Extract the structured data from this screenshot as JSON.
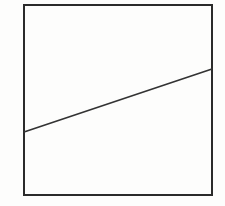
{
  "figure": {
    "background_color": "#fdfdfc",
    "square": {
      "x": 24,
      "y": 5,
      "width": 188,
      "height": 190,
      "stroke_color": "#2b2b2b",
      "stroke_width": 2,
      "fill": "none"
    },
    "diagonal_line": {
      "x1": 24,
      "y1": 132,
      "x2": 212,
      "y2": 69,
      "stroke_color": "#333333",
      "stroke_width": 1.7
    }
  }
}
